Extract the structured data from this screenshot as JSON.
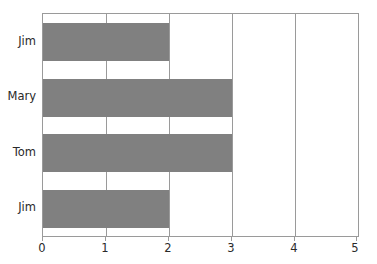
{
  "chart_data": {
    "type": "bar",
    "orientation": "horizontal",
    "title": "",
    "subtitle": "",
    "xlabel": "",
    "ylabel": "",
    "categories": [
      "Jim",
      "Mary",
      "Tom",
      "Jim"
    ],
    "values": [
      2,
      3,
      3,
      2
    ],
    "series": [
      {
        "name": "",
        "values": [
          2,
          3,
          3,
          2
        ]
      }
    ],
    "xlim": [
      0,
      5
    ],
    "xticks": [
      0,
      1,
      2,
      3,
      4,
      5
    ],
    "xtick_labels": [
      "0",
      "1",
      "2",
      "3",
      "4",
      "5"
    ],
    "ytick_labels": [
      "Jim",
      "Mary",
      "Tom",
      "Jim"
    ],
    "grid": true,
    "grid_axis": "x",
    "legend": false,
    "legend_position": "none",
    "annotations": [],
    "colors": {
      "bar": "#808080",
      "axis": "#9a9a9a",
      "grid": "#9a9a9a",
      "text": "#2a2a2a",
      "background": "#ffffff"
    }
  }
}
